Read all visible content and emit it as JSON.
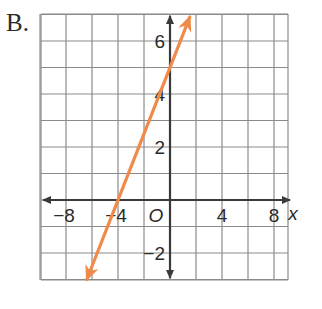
{
  "option_label": "B.",
  "chart_data": {
    "type": "line",
    "title": "",
    "xlabel": "x",
    "ylabel": "",
    "origin_label": "O",
    "xlim": [
      -10,
      9
    ],
    "ylim": [
      -3,
      7
    ],
    "x_ticks": [
      {
        "value": -8,
        "label": "−8"
      },
      {
        "value": -4,
        "label": "−4"
      },
      {
        "value": 4,
        "label": "4"
      },
      {
        "value": 8,
        "label": "8"
      }
    ],
    "y_ticks": [
      {
        "value": 6,
        "label": "6"
      },
      {
        "value": 4,
        "label": "4"
      },
      {
        "value": 2,
        "label": "2"
      },
      {
        "value": -2,
        "label": "−2"
      }
    ],
    "grid": true,
    "grid_spacing": {
      "x": 2,
      "y": 1
    },
    "series": [
      {
        "name": "line",
        "equation": "y = 1.25x + 5",
        "slope": 1.25,
        "y_intercept": 5,
        "x_intercept": -4,
        "points": [
          [
            -4,
            0
          ],
          [
            0,
            5
          ]
        ],
        "arrows": "both",
        "color": "#f08a4b"
      }
    ]
  },
  "colors": {
    "grid": "#8a8a8a",
    "axis": "#3a3a3a",
    "line": "#f08a4b",
    "text": "#2b2b2b"
  }
}
